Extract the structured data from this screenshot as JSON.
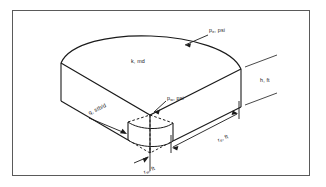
{
  "figure": {
    "type": "technical-diagram",
    "background_color": "#ffffff",
    "line_color": "#1a1a1a",
    "frame_color": "#5a5a5a"
  },
  "labels": {
    "external_pressure": {
      "symbol": "p",
      "subscript": "e",
      "unit": "psi",
      "text": "pe, psi"
    },
    "permeability": {
      "symbol": "k",
      "subscript": "",
      "unit": "md",
      "text": "k, md"
    },
    "thickness": {
      "symbol": "h",
      "subscript": "",
      "unit": "ft",
      "text": "h, ft"
    },
    "wellbore_pressure": {
      "symbol": "p",
      "subscript": "w",
      "unit": "psi",
      "text": "pw, psi"
    },
    "flow_rate": {
      "symbol": "q",
      "subscript": "",
      "unit": "stb/d",
      "text": "q, stb/d"
    },
    "external_radius": {
      "symbol": "r",
      "subscript": "e",
      "unit": "ft",
      "text": "re, ft"
    },
    "wellbore_radius": {
      "symbol": "r",
      "subscript": "w",
      "unit": "ft",
      "text": "rw, ft"
    }
  },
  "label_parts": {
    "pe_sym": "p",
    "pe_sub": "e",
    "pe_rest": ", psi",
    "k_text": "k, md",
    "h_text": "h, ft",
    "pw_sym": "p",
    "pw_sub": "w",
    "pw_rest": ", psi",
    "q_text": "q, stb/d",
    "re_sym": "r",
    "re_sub": "e",
    "re_rest": ", ft",
    "rw_sym": "r",
    "rw_sub": "w",
    "rw_rest": ", ft"
  }
}
